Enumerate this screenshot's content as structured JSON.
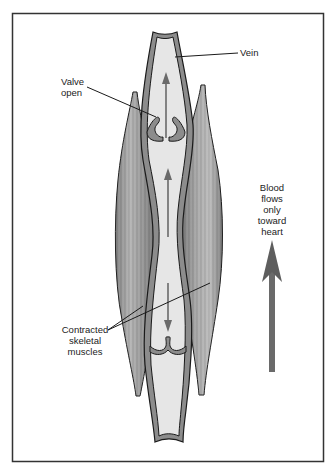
{
  "figure": {
    "labels": {
      "vein": "Vein",
      "valve_line1": "Valve",
      "valve_line2": "open",
      "muscles_line1": "Contracted",
      "muscles_line2": "skeletal",
      "muscles_line3": "muscles",
      "flow_line1": "Blood",
      "flow_line2": "flows",
      "flow_line3": "only",
      "flow_line4": "toward",
      "flow_line5": "heart"
    },
    "colors": {
      "frame": "#333333",
      "outline": "#1a1a1a",
      "vein_wall": "#8a8a8a",
      "vein_lumen": "#e6e6e6",
      "muscle": "#9a9a9a",
      "arrow": "#6a6a6a"
    }
  }
}
